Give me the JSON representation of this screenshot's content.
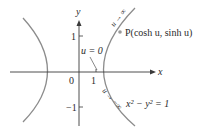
{
  "figure": {
    "axis_labels": {
      "x": "x",
      "y": "y"
    },
    "tick_labels": {
      "origin": "0",
      "x_one": "1",
      "y_one": "1",
      "y_neg_one": "−1"
    },
    "annotations": {
      "u_zero": "u = 0",
      "point_label": "P(cosh u, sinh u)",
      "u_to_inf": "u → ∞",
      "u_to_neg_inf": "u → −∞",
      "equation": "x² − y² = 1"
    },
    "colors": {
      "curve": "#8c8c8c",
      "axis": "#3a3a3a",
      "text": "#2a2a2a",
      "point": "#9a9a9a"
    }
  }
}
